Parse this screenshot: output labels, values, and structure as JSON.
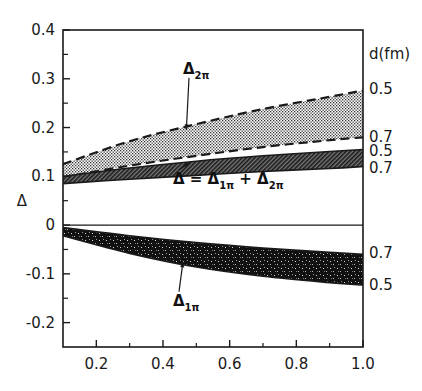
{
  "chart_data": {
    "type": "area",
    "title": "",
    "xlabel": "",
    "ylabel": "Δ",
    "xlim": [
      0.1,
      1.0
    ],
    "ylim": [
      -0.25,
      0.4
    ],
    "grid": false,
    "x_ticks": [
      0.2,
      0.4,
      0.6,
      0.8,
      1.0
    ],
    "x_tick_labels": [
      "0.2",
      "0.4",
      "0.6",
      "0.8",
      "1.0"
    ],
    "x_minor_ticks": [
      0.3,
      0.5,
      0.7,
      0.9
    ],
    "y_ticks": [
      0.4,
      0.3,
      0.2,
      0.1,
      0,
      -0.1,
      -0.2
    ],
    "y_tick_labels": [
      "0.4",
      "0.3",
      "0.2",
      "0.1",
      "0",
      "-0.1",
      "-0.2"
    ],
    "y_minor_ticks": [
      0.35,
      0.25,
      0.15,
      0.05,
      -0.05,
      -0.15
    ],
    "right_axis_title": "d(fm)",
    "x": [
      0.1,
      0.3,
      0.5,
      0.7,
      0.9,
      1.0
    ],
    "bands": [
      {
        "name": "Δ2π",
        "label_main": "Δ",
        "label_sub": "2π",
        "fill": "dotted",
        "edge_style": "dashed",
        "upper": {
          "d_fm": "0.5",
          "values": [
            0.125,
            0.172,
            0.207,
            0.238,
            0.263,
            0.276
          ]
        },
        "lower": {
          "d_fm": "0.7",
          "values": [
            0.098,
            0.122,
            0.142,
            0.16,
            0.174,
            0.18
          ]
        }
      },
      {
        "name": "Δ = Δ1π + Δ2π",
        "label_main": "Δ = Δ",
        "label_sub": "1π",
        "label_plus": " + Δ",
        "label_sub2": "2π",
        "fill": "hatched",
        "edge_style": "solid",
        "upper": {
          "d_fm": "0.5",
          "values": [
            0.1,
            0.117,
            0.131,
            0.142,
            0.151,
            0.155
          ]
        },
        "lower": {
          "d_fm": "0.7",
          "values": [
            0.085,
            0.094,
            0.102,
            0.11,
            0.116,
            0.12
          ]
        }
      },
      {
        "name": "Δ1π",
        "label_main": "Δ",
        "label_sub": "1π",
        "fill": "dense-speckle",
        "edge_style": "solid",
        "upper": {
          "d_fm": "0.7",
          "values": [
            -0.005,
            -0.022,
            -0.036,
            -0.047,
            -0.056,
            -0.06
          ]
        },
        "lower": {
          "d_fm": "0.5",
          "values": [
            -0.022,
            -0.058,
            -0.086,
            -0.105,
            -0.118,
            -0.123
          ]
        }
      }
    ],
    "right_labels": [
      {
        "text": "0.5",
        "value": 0.28
      },
      {
        "text": "0.7",
        "value": 0.18
      },
      {
        "text": "0.5",
        "value": 0.152
      },
      {
        "text": "0.7",
        "value": 0.118
      },
      {
        "text": "0.7",
        "value": -0.058
      },
      {
        "text": "0.5",
        "value": -0.122
      }
    ],
    "annotations": [
      {
        "band": 0,
        "text_x": 0.46,
        "text_y": 0.31,
        "arrow_to_x": 0.47,
        "arrow_to_y": 0.195
      },
      {
        "band": 1,
        "text_x": 0.43,
        "text_y": 0.085,
        "arrow_to_x": 0.48,
        "arrow_to_y": 0.128
      },
      {
        "band": 2,
        "text_x": 0.43,
        "text_y": -0.165,
        "arrow_to_x": 0.46,
        "arrow_to_y": -0.075
      }
    ]
  },
  "colors": {
    "axis": "#1a1a1a",
    "ink": "#111111",
    "background": "#ffffff"
  }
}
